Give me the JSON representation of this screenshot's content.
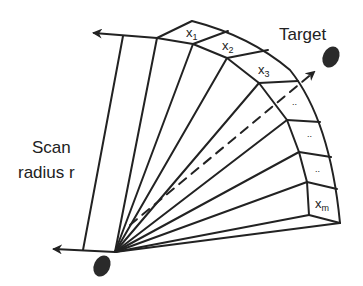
{
  "diagram": {
    "colors": {
      "stroke": "#222222",
      "fill": "#2a2a2a",
      "background": "#ffffff"
    },
    "labels": {
      "target": "Target",
      "scan_line1": "Scan",
      "scan_line2": "radius r",
      "cells": [
        {
          "base": "x",
          "sub": "1"
        },
        {
          "base": "x",
          "sub": "2"
        },
        {
          "base": "x",
          "sub": "3"
        },
        {
          "base": "..",
          "sub": ""
        },
        {
          "base": "..",
          "sub": ""
        },
        {
          "base": "..",
          "sub": ""
        },
        {
          "base": "x",
          "sub": "m"
        }
      ]
    },
    "elements": {
      "origin": "sensor-ellipse",
      "target_marker": "target-ellipse",
      "arrows": [
        "left-boundary-arrow",
        "top-boundary-arrow",
        "direction-to-target-dashed-arrow"
      ]
    }
  }
}
